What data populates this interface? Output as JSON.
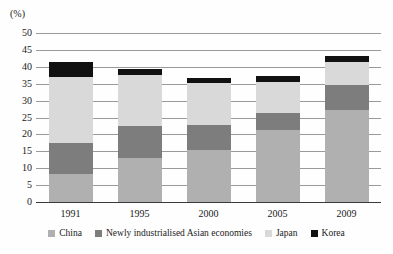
{
  "chart_data": {
    "type": "bar",
    "stacked": true,
    "title": "",
    "subtitle": "",
    "xlabel": "",
    "ylabel": "(%)",
    "unit_label": "(%)",
    "categories": [
      "1991",
      "1995",
      "2000",
      "2005",
      "2009"
    ],
    "ylim": [
      0,
      50
    ],
    "ytick_step": 5,
    "yticks": [
      "50",
      "45",
      "40",
      "35",
      "30",
      "25",
      "20",
      "15",
      "10",
      "5",
      "0"
    ],
    "grid": true,
    "legend_position": "bottom",
    "series": [
      {
        "name": "China",
        "color": "#b0b0b0",
        "values": [
          8.3,
          13.0,
          15.5,
          21.2,
          27.2
        ]
      },
      {
        "name": "Newly industrialised Asian economies",
        "color": "#7d7d7d",
        "values": [
          9.2,
          9.6,
          7.3,
          5.1,
          7.4
        ]
      },
      {
        "name": "Japan",
        "color": "#d9d9d9",
        "values": [
          19.5,
          15.0,
          12.4,
          9.2,
          6.8
        ]
      },
      {
        "name": "Korea",
        "color": "#111111",
        "values": [
          4.5,
          1.7,
          1.6,
          1.8,
          1.8
        ]
      }
    ],
    "cumulative_tops": {
      "1991": [
        8.3,
        17.5,
        37.0,
        41.5
      ],
      "1995": [
        13.0,
        22.6,
        37.6,
        39.3
      ],
      "2000": [
        15.5,
        22.8,
        35.2,
        36.8
      ],
      "2005": [
        21.2,
        26.3,
        35.5,
        37.3
      ],
      "2009": [
        27.2,
        34.6,
        41.4,
        43.2
      ]
    },
    "totals": [
      41.5,
      39.3,
      36.8,
      37.3,
      43.2
    ]
  },
  "legend": {
    "items": [
      {
        "label": "China",
        "color": "#b0b0b0"
      },
      {
        "label": "Newly industrialised Asian economies",
        "color": "#7d7d7d"
      },
      {
        "label": "Japan",
        "color": "#d9d9d9"
      },
      {
        "label": "Korea",
        "color": "#111111"
      }
    ]
  },
  "colors": {
    "china": "#b0b0b0",
    "nie": "#7d7d7d",
    "japan": "#d9d9d9",
    "korea": "#111111",
    "gridline": "#9a9a9a",
    "axis": "#3a3a3a",
    "text": "#1a1a1a",
    "background": "#fefefe"
  }
}
